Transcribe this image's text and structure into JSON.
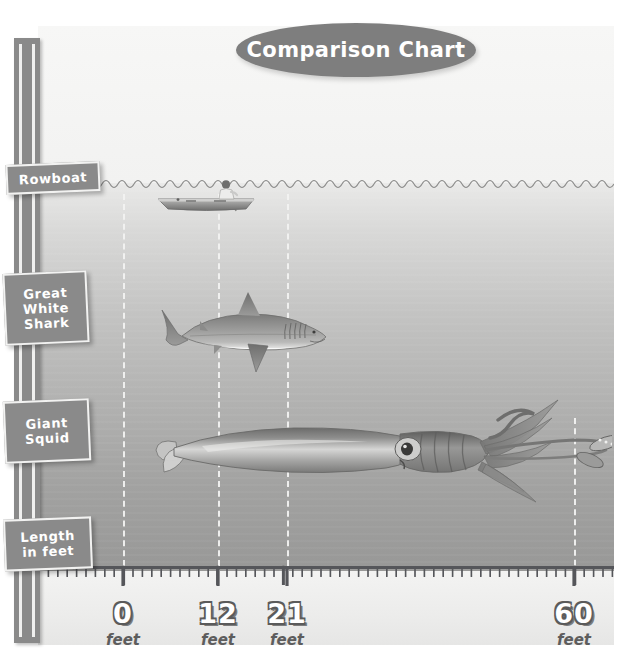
{
  "title": {
    "text": "Comparison Chart"
  },
  "chart_data": {
    "type": "bar",
    "title": "Comparison Chart",
    "xlabel": "Length in feet",
    "ylabel": "",
    "categories": [
      "Rowboat",
      "Great White Shark",
      "Giant Squid"
    ],
    "values": [
      12,
      21,
      60
    ],
    "unit": "feet",
    "x": [
      0,
      12,
      21,
      60
    ],
    "xlim": [
      0,
      60
    ],
    "grid": true,
    "legend": "none",
    "axis_tick_labels": [
      "0",
      "12",
      "21",
      "60"
    ],
    "axis_tick_units": [
      "feet",
      "feet",
      "feet",
      "feet"
    ]
  },
  "axis": {
    "ticks": [
      {
        "value": "0",
        "unit": "feet",
        "x_px": 123
      },
      {
        "value": "12",
        "unit": "feet",
        "x_px": 218
      },
      {
        "value": "21",
        "unit": "feet",
        "x_px": 287
      },
      {
        "value": "60",
        "unit": "feet",
        "x_px": 574
      }
    ]
  },
  "signs": {
    "rowboat": {
      "label": "Rowboat"
    },
    "shark": {
      "label": "Great\nWhite\nShark"
    },
    "squid": {
      "label": "Giant\nSquid"
    },
    "length": {
      "label": "Length\nin feet"
    }
  },
  "illustrations": [
    {
      "name": "rowboat-illustration",
      "subject": "Rowboat with rower",
      "length_feet": 12
    },
    {
      "name": "shark-illustration",
      "subject": "Great White Shark",
      "length_feet": 21
    },
    {
      "name": "squid-illustration",
      "subject": "Giant Squid",
      "length_feet": 60
    }
  ],
  "colors": {
    "sign_fill": "#8a8a8a",
    "sign_border": "#f2f2f1",
    "title_fill": "#7e7e7e",
    "text_on_sign": "#ffffff",
    "water_top": "#e9e9e8",
    "water_bottom": "#989897",
    "ruler_fill": "#ececeb",
    "guide_line": "#f3f3f2",
    "tick_mark": "#55565a"
  }
}
